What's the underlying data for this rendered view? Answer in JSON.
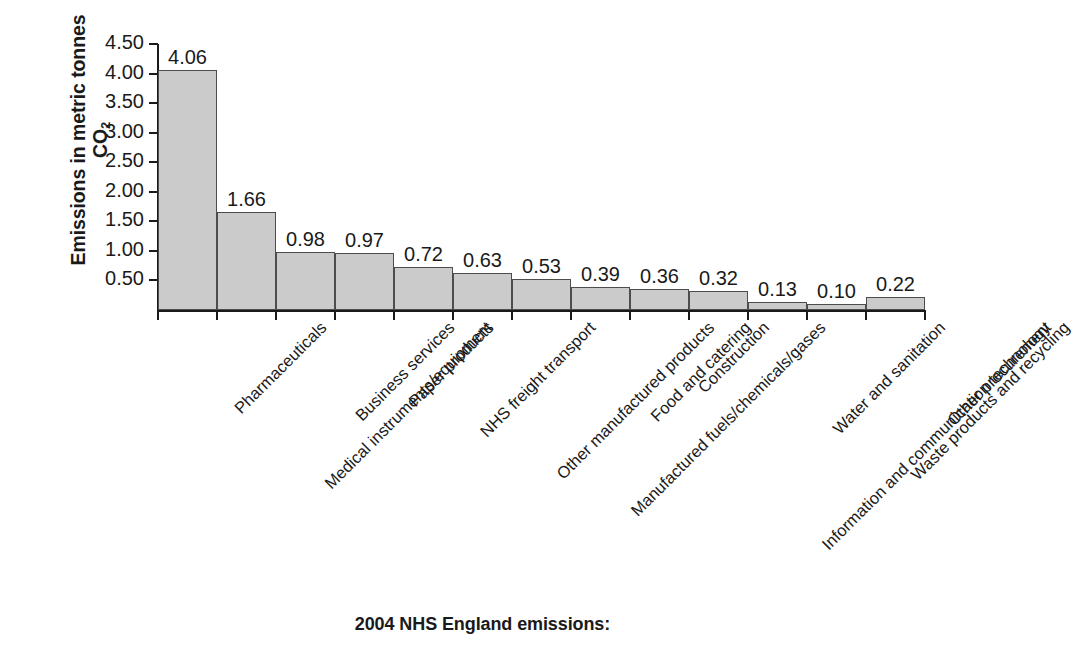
{
  "chart_data": {
    "type": "bar",
    "title": "2004 NHS England emissions:",
    "xlabel": "",
    "ylabel": "Emissions in metric tonnes CO2",
    "ylabel_line1": "Emissions in metric tonnes",
    "ylabel_line2_prefix": "CO",
    "ylabel_line2_sub": "2",
    "ylim": [
      0,
      4.5
    ],
    "ytick_labels": [
      "0.50",
      "1.00",
      "1.50",
      "2.00",
      "2.50",
      "3.00",
      "3.50",
      "4.00",
      "4.50"
    ],
    "ytick_values": [
      0.5,
      1.0,
      1.5,
      2.0,
      2.5,
      3.0,
      3.5,
      4.0,
      4.5
    ],
    "grid": false,
    "legend": false,
    "bar_fill_color": "#cbcbcb",
    "bar_edge_color": "#4d4d4d",
    "categories": [
      "Pharmaceuticals",
      "Medical instruments/equipment",
      "Business services",
      "Paper products",
      "NHS freight transport",
      "Other manufactured products",
      "Manufactured fuels/chemicals/gases",
      "Food and catering",
      "Construction",
      "Information and communication technology",
      "Water and sanitation",
      "Waste products and recycling",
      "Other procurement"
    ],
    "values": [
      4.06,
      1.66,
      0.98,
      0.97,
      0.72,
      0.63,
      0.53,
      0.39,
      0.36,
      0.32,
      0.13,
      0.1,
      0.22
    ],
    "value_labels": [
      "4.06",
      "1.66",
      "0.98",
      "0.97",
      "0.72",
      "0.63",
      "0.53",
      "0.39",
      "0.36",
      "0.32",
      "0.13",
      "0.10",
      "0.22"
    ]
  }
}
